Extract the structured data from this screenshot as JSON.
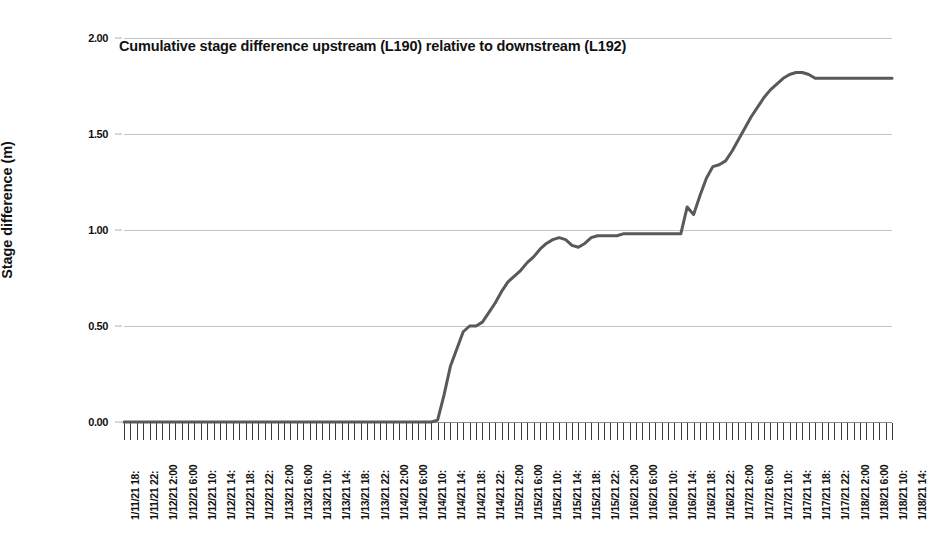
{
  "chart_data": {
    "type": "line",
    "title": "Cumulative stage difference upstream (L190) relative to downstream (L192)",
    "xlabel": "",
    "ylabel": "Stage difference (m)",
    "ylim": [
      0.0,
      2.0
    ],
    "yticks": [
      0.0,
      0.5,
      1.0,
      1.5,
      2.0
    ],
    "ytick_labels": [
      "0.00",
      "0.50",
      "1.00",
      "1.50",
      "2.00"
    ],
    "grid": true,
    "legend": "none",
    "line_color": "#595959",
    "line_width": 3,
    "x": [
      "1/11/21 18:",
      "1/11/21 22:",
      "1/12/21 2:00",
      "1/12/21 6:00",
      "1/12/21 10:",
      "1/12/21 14:",
      "1/12/21 18:",
      "1/12/21 22:",
      "1/13/21 2:00",
      "1/13/21 6:00",
      "1/13/21 10:",
      "1/13/21 14:",
      "1/13/21 18:",
      "1/13/21 22:",
      "1/14/21 2:00",
      "1/14/21 6:00",
      "1/14/21 10:",
      "1/14/21 14:",
      "1/14/21 18:",
      "1/14/21 22:",
      "1/15/21 2:00",
      "1/15/21 6:00",
      "1/15/21 10:",
      "1/15/21 14:",
      "1/15/21 18:",
      "1/15/21 22:",
      "1/16/21 2:00",
      "1/16/21 6:00",
      "1/16/21 10:",
      "1/16/21 14:",
      "1/16/21 18:",
      "1/16/21 22:",
      "1/17/21 2:00",
      "1/17/21 6:00",
      "1/17/21 10:",
      "1/17/21 14:",
      "1/17/21 18:",
      "1/17/21 22:",
      "1/18/21 2:00",
      "1/18/21 6:00",
      "1/18/21 10:",
      "1/18/21 14:"
    ],
    "x_tick_count": 121,
    "values_dense": [
      0.0,
      0.0,
      0.0,
      0.0,
      0.0,
      0.0,
      0.0,
      0.0,
      0.0,
      0.0,
      0.0,
      0.0,
      0.0,
      0.0,
      0.0,
      0.0,
      0.0,
      0.0,
      0.0,
      0.0,
      0.0,
      0.0,
      0.0,
      0.0,
      0.0,
      0.0,
      0.0,
      0.0,
      0.0,
      0.0,
      0.0,
      0.0,
      0.0,
      0.0,
      0.0,
      0.0,
      0.0,
      0.0,
      0.0,
      0.0,
      0.0,
      0.0,
      0.0,
      0.0,
      0.0,
      0.0,
      0.0,
      0.0,
      0.0,
      0.01,
      0.14,
      0.29,
      0.38,
      0.47,
      0.5,
      0.5,
      0.52,
      0.57,
      0.62,
      0.68,
      0.73,
      0.76,
      0.79,
      0.83,
      0.86,
      0.9,
      0.93,
      0.95,
      0.96,
      0.95,
      0.92,
      0.91,
      0.93,
      0.96,
      0.97,
      0.97,
      0.97,
      0.97,
      0.98,
      0.98,
      0.98,
      0.98,
      0.98,
      0.98,
      0.98,
      0.98,
      0.98,
      0.98,
      1.12,
      1.08,
      1.18,
      1.27,
      1.33,
      1.34,
      1.36,
      1.41,
      1.47,
      1.53,
      1.59,
      1.64,
      1.69,
      1.73,
      1.76,
      1.79,
      1.81,
      1.82,
      1.82,
      1.81,
      1.79,
      1.79,
      1.79,
      1.79,
      1.79,
      1.79,
      1.79,
      1.79,
      1.79,
      1.79,
      1.79,
      1.79,
      1.79
    ],
    "key_points": [
      {
        "label": "start of rise",
        "x": "1/14/21 10:",
        "y": 0.0
      },
      {
        "label": "first shoulder",
        "x": "1/14/21 18:",
        "y": 0.5
      },
      {
        "label": "plateau near 1 m",
        "x": "1/15/21 22:",
        "y": 0.96
      },
      {
        "label": "step up",
        "x": "1/16/21 14:",
        "y": 1.12
      },
      {
        "label": "peak",
        "x": "1/17/21 18:",
        "y": 1.82
      },
      {
        "label": "final plateau",
        "x": "1/18/21 14:",
        "y": 1.79
      }
    ]
  },
  "axes": {
    "y_title": "Stage difference (m)"
  }
}
